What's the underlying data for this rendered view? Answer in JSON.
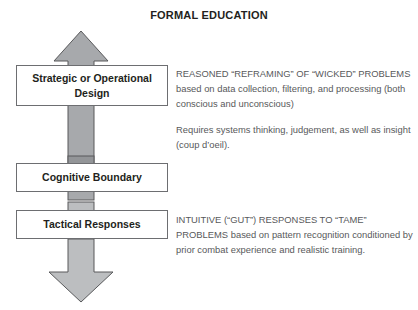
{
  "title": "FORMAL EDUCATION",
  "boxes": {
    "strategic": "Strategic or Operational Design",
    "cognitive": "Cognitive Boundary",
    "tactical": "Tactical Responses"
  },
  "notes": {
    "strategic": {
      "para1": "REASONED “REFRAMING” OF “WICKED” PROBLEMS based on data collection, filtering, and processing (both conscious and unconscious)",
      "para2": "Requires systems thinking, judgement, as well as insight (coup d’oeil)."
    },
    "tactical": {
      "para1": "INTUITIVE (“GUT”) RESPONSES TO “TAME” PROBLEMS based on pattern recognition conditioned by prior combat experience and realistic training."
    }
  },
  "arrows": {
    "up_arrow_name": "upward-arrow",
    "down_arrow_name": "downward-arrow",
    "connector_above_cognitive": "connector-segment-dark",
    "connector_below_cognitive": "connector-segment-light",
    "connector_above_tactical": "connector-segment-light"
  },
  "colors": {
    "arrow_fill": "#a7a9ac",
    "arrow_fill_dark": "#939598",
    "arrow_stroke": "#58595b",
    "box_border": "#6d6e71",
    "box_fill": "#ffffff",
    "title_text": "#231f20",
    "body_text": "#58595b",
    "background": "#ffffff"
  }
}
